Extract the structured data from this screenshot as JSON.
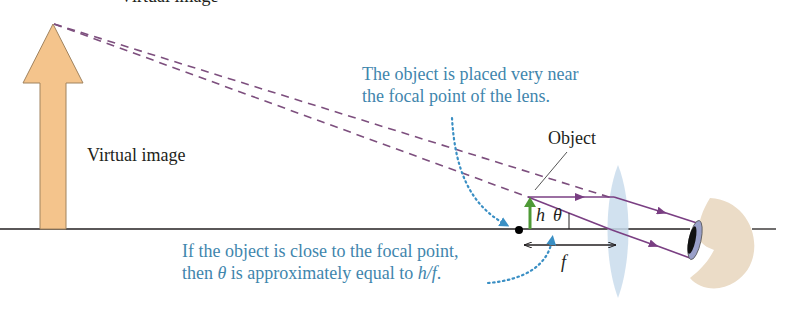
{
  "diagram": {
    "title_partial": "Virtual image",
    "labels": {
      "virtual_image": "Virtual image",
      "object": "Object",
      "h": "h",
      "theta": "θ",
      "f": "f"
    },
    "annotations": {
      "top": {
        "line1": "The object is placed very near",
        "line2": "the focal point of the lens."
      },
      "bottom": {
        "line1": "If the object is close to the focal point,",
        "line2_pre": "then ",
        "line2_theta": "θ",
        "line2_mid": " is approximately equal to ",
        "line2_ratio": "h/f",
        "line2_post": "."
      }
    },
    "colors": {
      "virtual_image_fill": "#f4c48c",
      "virtual_image_stroke": "#a0835f",
      "dashed_ray": "#7d4f7e",
      "ray": "#7a3f83",
      "object_arrow": "#4e9a36",
      "annotation_blue": "#3f86ad",
      "dotted_arrow": "#3a8fc4",
      "lens_fill": "#c9dcec",
      "eye_skin": "#ebdcc7",
      "iris": "#9aa0c9",
      "axis": "#231f20"
    }
  }
}
